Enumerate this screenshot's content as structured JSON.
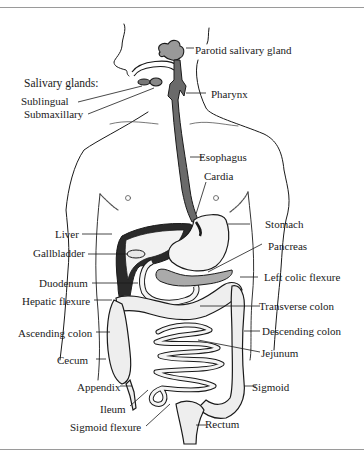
{
  "diagram": {
    "colors": {
      "ink": "#1a1a1a",
      "rule": "#9a9a9a",
      "background": "#ffffff"
    },
    "heading": "Salivary glands:",
    "labels_left": [
      {
        "id": "sublingual",
        "text": "Sublingual"
      },
      {
        "id": "submaxillary",
        "text": "Submaxillary"
      },
      {
        "id": "liver",
        "text": "Liver"
      },
      {
        "id": "gallbladder",
        "text": "Gallbladder"
      },
      {
        "id": "duodenum",
        "text": "Duodenum"
      },
      {
        "id": "hepatic-flexure",
        "text": "Hepatic flexure"
      },
      {
        "id": "ascending-colon",
        "text": "Ascending colon"
      },
      {
        "id": "cecum",
        "text": "Cecum"
      },
      {
        "id": "appendix",
        "text": "Appendix"
      },
      {
        "id": "ileum",
        "text": "Ileum"
      },
      {
        "id": "sigmoid-flexure",
        "text": "Sigmoid flexure"
      }
    ],
    "labels_right": [
      {
        "id": "parotid",
        "text": "Parotid salivary gland"
      },
      {
        "id": "pharynx",
        "text": "Pharynx"
      },
      {
        "id": "esophagus",
        "text": "Esophagus"
      },
      {
        "id": "cardia",
        "text": "Cardia"
      },
      {
        "id": "stomach",
        "text": "Stomach"
      },
      {
        "id": "pancreas",
        "text": "Pancreas"
      },
      {
        "id": "left-colic-flexure",
        "text": "Left colic flexure"
      },
      {
        "id": "transverse-colon",
        "text": "Transverse colon"
      },
      {
        "id": "descending-colon",
        "text": "Descending colon"
      },
      {
        "id": "jejunum",
        "text": "Jejunum"
      },
      {
        "id": "sigmoid",
        "text": "Sigmoid"
      },
      {
        "id": "rectum",
        "text": "Rectum"
      }
    ]
  }
}
